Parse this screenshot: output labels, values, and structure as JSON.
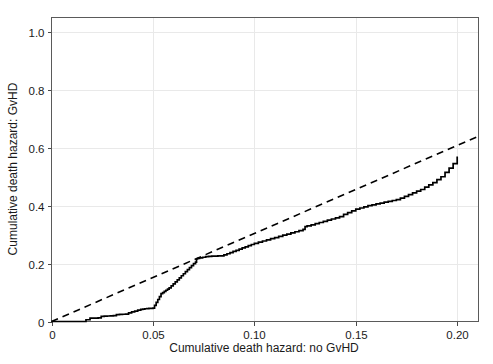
{
  "chart_data": {
    "type": "line",
    "title": "",
    "xlabel": "Cumulative death hazard: no GvHD",
    "ylabel": "Cumulative death hazard: GvHD",
    "xlim": [
      0,
      0.2105
    ],
    "ylim": [
      0,
      1.05
    ],
    "xticks": [
      0,
      0.05,
      0.1,
      0.15,
      0.2
    ],
    "xticklabels": [
      "0",
      "0.05",
      "0.10",
      "0.15",
      "0.20"
    ],
    "yticks": [
      0,
      0.2,
      0.4,
      0.6,
      0.8,
      1.0
    ],
    "yticklabels": [
      "0",
      "0.2",
      "0.4",
      "0.6",
      "0.8",
      "1.0"
    ],
    "grid": true,
    "legend": "none",
    "series": [
      {
        "name": "empirical cumulative hazard (step)",
        "style": "solid",
        "color": "#000000",
        "step": "post",
        "x": [
          0.0,
          0.002,
          0.004,
          0.006,
          0.008,
          0.01,
          0.012,
          0.014,
          0.016,
          0.017,
          0.018,
          0.019,
          0.02,
          0.0215,
          0.023,
          0.0245,
          0.026,
          0.0275,
          0.029,
          0.0305,
          0.032,
          0.0335,
          0.035,
          0.0365,
          0.038,
          0.0395,
          0.041,
          0.0425,
          0.044,
          0.045,
          0.046,
          0.047,
          0.048,
          0.049,
          0.05,
          0.0508,
          0.0516,
          0.0524,
          0.0532,
          0.054,
          0.0548,
          0.0556,
          0.0564,
          0.0572,
          0.058,
          0.059,
          0.06,
          0.061,
          0.062,
          0.063,
          0.064,
          0.065,
          0.066,
          0.067,
          0.068,
          0.069,
          0.07,
          0.071,
          0.0715,
          0.072,
          0.073,
          0.0745,
          0.076,
          0.0775,
          0.079,
          0.0805,
          0.082,
          0.0835,
          0.085,
          0.0865,
          0.088,
          0.0895,
          0.091,
          0.0925,
          0.094,
          0.0955,
          0.097,
          0.0985,
          0.1,
          0.102,
          0.104,
          0.106,
          0.108,
          0.11,
          0.112,
          0.114,
          0.116,
          0.118,
          0.12,
          0.122,
          0.124,
          0.125,
          0.126,
          0.128,
          0.13,
          0.132,
          0.134,
          0.136,
          0.138,
          0.14,
          0.142,
          0.144,
          0.146,
          0.148,
          0.15,
          0.152,
          0.154,
          0.156,
          0.158,
          0.16,
          0.162,
          0.164,
          0.166,
          0.168,
          0.17,
          0.172,
          0.174,
          0.176,
          0.178,
          0.18,
          0.182,
          0.184,
          0.186,
          0.188,
          0.19,
          0.192,
          0.194,
          0.196,
          0.198,
          0.2
        ],
        "y": [
          0.0,
          0.0,
          0.0,
          0.0,
          0.0,
          0.0,
          0.0,
          0.0,
          0.0,
          0.006,
          0.006,
          0.0115,
          0.0115,
          0.012,
          0.0125,
          0.018,
          0.0185,
          0.019,
          0.0195,
          0.02,
          0.024,
          0.0245,
          0.025,
          0.0255,
          0.03,
          0.033,
          0.036,
          0.039,
          0.042,
          0.043,
          0.044,
          0.0445,
          0.045,
          0.0455,
          0.046,
          0.056,
          0.066,
          0.076,
          0.086,
          0.096,
          0.1,
          0.104,
          0.108,
          0.112,
          0.116,
          0.123,
          0.13,
          0.137,
          0.144,
          0.151,
          0.158,
          0.165,
          0.172,
          0.179,
          0.186,
          0.193,
          0.2,
          0.205,
          0.216,
          0.218,
          0.22,
          0.222,
          0.224,
          0.225,
          0.2255,
          0.226,
          0.2265,
          0.227,
          0.23,
          0.234,
          0.238,
          0.242,
          0.246,
          0.25,
          0.254,
          0.258,
          0.262,
          0.266,
          0.27,
          0.274,
          0.278,
          0.282,
          0.286,
          0.29,
          0.294,
          0.298,
          0.302,
          0.306,
          0.31,
          0.314,
          0.318,
          0.328,
          0.33,
          0.334,
          0.338,
          0.342,
          0.346,
          0.35,
          0.354,
          0.358,
          0.362,
          0.37,
          0.376,
          0.382,
          0.388,
          0.392,
          0.396,
          0.4,
          0.403,
          0.406,
          0.409,
          0.412,
          0.415,
          0.418,
          0.421,
          0.426,
          0.432,
          0.438,
          0.444,
          0.45,
          0.456,
          0.464,
          0.472,
          0.48,
          0.49,
          0.5,
          0.515,
          0.53,
          0.545,
          0.57
        ],
        "x_end": 0.2,
        "y_end": 0.57
      },
      {
        "name": "reference line",
        "style": "dashed",
        "color": "#000000",
        "x": [
          0.0,
          0.2105
        ],
        "y": [
          0.0,
          0.64
        ],
        "slope": 3.04
      }
    ]
  },
  "axes": {
    "x_axis_title": "Cumulative death hazard: no GvHD",
    "y_axis_title": "Cumulative death hazard: GvHD"
  }
}
